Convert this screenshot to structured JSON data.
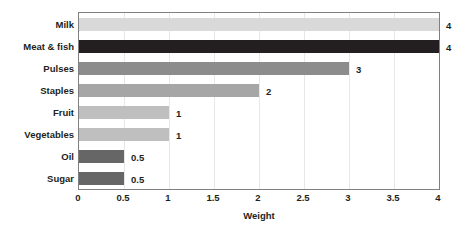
{
  "chart_data": {
    "type": "bar",
    "orientation": "horizontal",
    "title": "",
    "xlabel": "Weight",
    "ylabel": "",
    "xlim": [
      0,
      4
    ],
    "xticks": [
      "0",
      "0.5",
      "1",
      "1.5",
      "2",
      "2.5",
      "3",
      "3.5",
      "4"
    ],
    "xtick_values": [
      0,
      0.5,
      1,
      1.5,
      2,
      2.5,
      3,
      3.5,
      4
    ],
    "grid": true,
    "grid_axis": "x",
    "legend": "none",
    "categories": [
      "Milk",
      "Meat & fish",
      "Pulses",
      "Staples",
      "Fruit",
      "Vegetables",
      "Oil",
      "Sugar"
    ],
    "values": [
      4,
      4,
      3,
      2,
      1,
      1,
      0.5,
      0.5
    ],
    "value_labels": [
      "4",
      "4",
      "3",
      "2",
      "1",
      "1",
      "0.5",
      "0.5"
    ],
    "bar_colors": [
      "#d9d9d9",
      "#231f20",
      "#8c8c8c",
      "#a6a6a6",
      "#bfbfbf",
      "#bfbfbf",
      "#666666",
      "#666666"
    ],
    "bars": [
      {
        "category": "Milk",
        "value": 4,
        "label": "4",
        "color": "#d9d9d9"
      },
      {
        "category": "Meat & fish",
        "value": 4,
        "label": "4",
        "color": "#231f20"
      },
      {
        "category": "Pulses",
        "value": 3,
        "label": "3",
        "color": "#8c8c8c"
      },
      {
        "category": "Staples",
        "value": 2,
        "label": "2",
        "color": "#a6a6a6"
      },
      {
        "category": "Fruit",
        "value": 1,
        "label": "1",
        "color": "#bfbfbf"
      },
      {
        "category": "Vegetables",
        "value": 1,
        "label": "1",
        "color": "#bfbfbf"
      },
      {
        "category": "Oil",
        "value": 0.5,
        "label": "0.5",
        "color": "#666666"
      },
      {
        "category": "Sugar",
        "value": 0.5,
        "label": "0.5",
        "color": "#666666"
      }
    ]
  },
  "style": {
    "axis_color": "#808080",
    "grid_color": "#e8e8e8",
    "text_color": "#231f20",
    "background": "#ffffff"
  }
}
